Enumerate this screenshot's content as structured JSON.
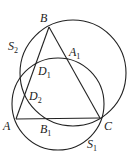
{
  "diagram": {
    "type": "geometry",
    "points": {
      "A": {
        "x": 16,
        "y": 119,
        "label": "A",
        "sub": ""
      },
      "B": {
        "x": 49,
        "y": 27,
        "label": "B",
        "sub": ""
      },
      "C": {
        "x": 100,
        "y": 118,
        "label": "C",
        "sub": ""
      },
      "A1": {
        "x": 66,
        "y": 57,
        "label": "A",
        "sub": "1"
      },
      "B1": {
        "x": 45,
        "y": 119,
        "label": "B",
        "sub": "1"
      },
      "D1": {
        "x": 37,
        "y": 62,
        "label": "D",
        "sub": "1"
      },
      "D2": {
        "x": 27,
        "y": 91,
        "label": "D",
        "sub": "2"
      }
    },
    "circles": {
      "S1": {
        "cx": 58,
        "cy": 104,
        "r": 46,
        "label": "S",
        "sub": "1"
      },
      "S2": {
        "cx": 73,
        "cy": 73,
        "r": 53,
        "label": "S",
        "sub": "2"
      }
    },
    "segments": [
      "AB",
      "BC",
      "CA"
    ],
    "colors": {
      "stroke": "#222222",
      "background": "#ffffff"
    }
  }
}
